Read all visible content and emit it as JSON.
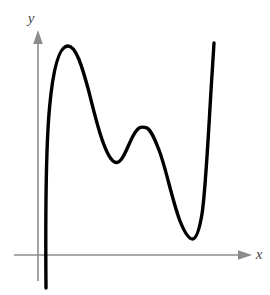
{
  "figure": {
    "kind": "math-function-graph",
    "background_color": "#ffffff",
    "width": 270,
    "height": 295,
    "axis_color": "#8c8c8c",
    "curve_color": "#000000",
    "label_color": "#4a4a4a",
    "curve_width": 3.4,
    "axis_width": 1.6
  },
  "axes": {
    "x_axis": {
      "label": "x",
      "label_x": 257,
      "label_y": 259,
      "line_y": 255,
      "line_x_start": 14,
      "line_x_end": 244,
      "arrow_tip_x": 252,
      "has_arrow": true,
      "has_ticks": false,
      "tick_labels": []
    },
    "y_axis": {
      "label": "y",
      "label_x": 31,
      "label_y": 23,
      "line_x": 38,
      "line_y_start": 38,
      "line_y_end": 281,
      "arrow_tip_y": 30,
      "has_arrow": true,
      "has_ticks": false,
      "tick_labels": []
    }
  },
  "chart_data": {
    "type": "line",
    "title": "",
    "subtitle": "",
    "xlabel": "x",
    "ylabel": "y",
    "grid": false,
    "legend": [],
    "legend_position": "none",
    "xlim": [
      38,
      270
    ],
    "ylim": [
      295,
      0
    ],
    "annotations": [],
    "series": [
      {
        "name": "curve",
        "color": "#000000",
        "points": [
          [
            46,
            287
          ],
          [
            46,
            255
          ],
          [
            47,
            200
          ],
          [
            49,
            150
          ],
          [
            52,
            110
          ],
          [
            56,
            80
          ],
          [
            61,
            58
          ],
          [
            68,
            46
          ],
          [
            75,
            48
          ],
          [
            82,
            61
          ],
          [
            89,
            84
          ],
          [
            96,
            110
          ],
          [
            103,
            138
          ],
          [
            109,
            154
          ],
          [
            113,
            161
          ],
          [
            118,
            160
          ],
          [
            124,
            151
          ],
          [
            131,
            139
          ],
          [
            138,
            130
          ],
          [
            145,
            127
          ],
          [
            152,
            131
          ],
          [
            159,
            144
          ],
          [
            166,
            166
          ],
          [
            173,
            193
          ],
          [
            180,
            217
          ],
          [
            186,
            231
          ],
          [
            192,
            238
          ],
          [
            197,
            234
          ],
          [
            201,
            218
          ],
          [
            205,
            185
          ],
          [
            208,
            140
          ],
          [
            211,
            90
          ],
          [
            213,
            55
          ],
          [
            214,
            43
          ]
        ],
        "path_d": "M 46 288 C 45.6 240 45.6 150 49.5 108 C 53.5 64 60 46 68 46 C 76 46 82 66 89 92 C 96 120 104 153 113 161 C 121.5 168 126.5 148 133 136 C 139 125 142 127 145.5 127.5 C 150 128 154 137 159 150 C 166 168 172 200 180 221 C 186 236 189.5 239 192.5 239 C 196 239 199 232 202 214 C 206 188 209 120 212 75 C 213 58 213.6 48 214 43"
      }
    ],
    "features": {
      "local_maxima": [
        [
          68,
          46
        ],
        [
          145,
          127
        ]
      ],
      "local_minima": [
        [
          113,
          161
        ],
        [
          192,
          238
        ]
      ],
      "x_axis_crossings": [
        [
          46,
          255
        ]
      ],
      "description": "A smooth polynomial-like curve rising steeply from below the x-axis near the y-axis, reaching a tall first local maximum, dipping to a local minimum, rising to a lower second local maximum, dropping to a deep local minimum just above the x-axis, then rising steeply off the top right."
    }
  }
}
